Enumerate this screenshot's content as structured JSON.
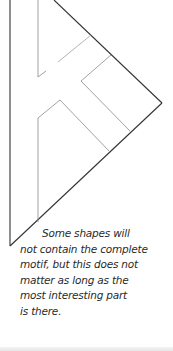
{
  "figure": {
    "stroke_color": "#333333",
    "inner_stroke_color": "#8a8a8a"
  },
  "caption": {
    "lines": [
      "Some shapes will",
      "not contain the complete",
      "motif, but this does not",
      "matter as long as the",
      "most interesting part",
      "is there."
    ]
  }
}
